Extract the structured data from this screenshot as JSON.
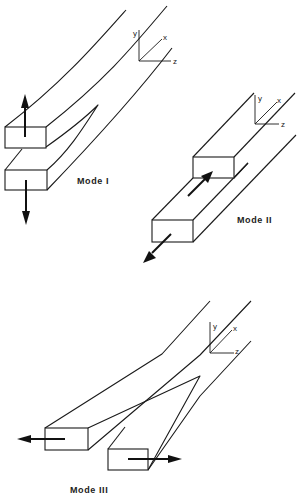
{
  "figure": {
    "modes": [
      {
        "id": "mode-1",
        "label": "Mode I",
        "description": "Opening mode: upper and lower arms pulled apart in y direction",
        "axes": {
          "y": "y",
          "x": "x",
          "z": "z"
        }
      },
      {
        "id": "mode-2",
        "label": "Mode II",
        "description": "Sliding (in-plane shear) mode: arms slide opposite along x",
        "axes": {
          "y": "y",
          "x": "x",
          "z": "z"
        }
      },
      {
        "id": "mode-3",
        "label": "Mode III",
        "description": "Tearing (out-of-plane shear) mode: arms pulled opposite along z",
        "axes": {
          "y": "y",
          "x": "x",
          "z": "z"
        }
      }
    ],
    "colors": {
      "line": "#1a1a1a",
      "background": "#ffffff"
    }
  }
}
